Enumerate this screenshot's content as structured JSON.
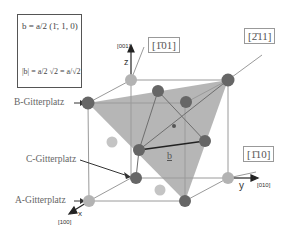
{
  "formula": {
    "vector_name": "b",
    "vector_def": "b = a/2 (1̄, 1, 0)",
    "prefactor_num": "a",
    "prefactor_den": "2",
    "components": [
      "1̄",
      "1",
      "0"
    ],
    "magnitude": "|b| = a/2 √2 = a/√2"
  },
  "directions": {
    "d101": "[1̄01]",
    "d211": "[2̄11]",
    "d110": "[1̄10]"
  },
  "axes": {
    "z_label": "z",
    "z_index": "[001]",
    "y_label": "y",
    "y_index": "[010]",
    "x_label": "x",
    "x_index": "[100]"
  },
  "lattice_sites": {
    "B": "B-Gitterplatz",
    "C": "C-Gitterplatz",
    "A": "A-Gitterplatz"
  },
  "vector_label": "b",
  "colors": {
    "plane_fill": "#a8a8a8",
    "dark_atom": "#6a6a6a",
    "light_atom": "#b4b4b4",
    "line": "#8a8a8a"
  }
}
